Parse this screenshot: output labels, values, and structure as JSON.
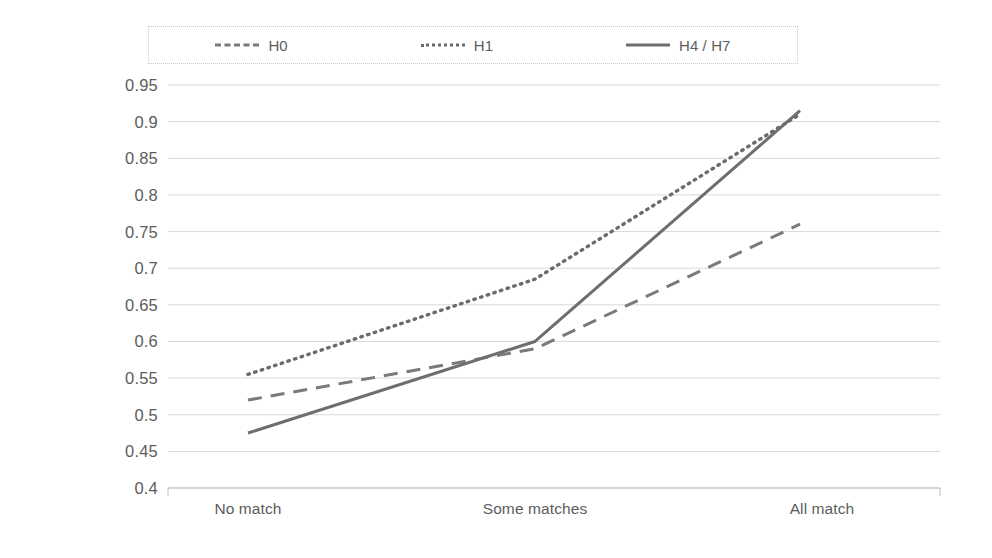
{
  "legend": {
    "position": "top",
    "border": "dotted",
    "entries": [
      {
        "label": "H0",
        "style": "dashed",
        "color": "#7a7a7a"
      },
      {
        "label": "H1",
        "style": "dotted",
        "color": "#6b6b6b"
      },
      {
        "label": "H4 / H7",
        "style": "solid",
        "color": "#6e6e6e"
      }
    ]
  },
  "axes": {
    "y_ticks": [
      "0.95",
      "0.9",
      "0.85",
      "0.8",
      "0.75",
      "0.7",
      "0.65",
      "0.6",
      "0.55",
      "0.5",
      "0.45",
      "0.4"
    ],
    "x_ticks": [
      "No match",
      "Some matches",
      "All match"
    ]
  },
  "chart_data": {
    "type": "line",
    "title": "",
    "subtitle": "",
    "xlabel": "",
    "ylabel": "",
    "categories": [
      "No match",
      "Some matches",
      "All match"
    ],
    "series": [
      {
        "name": "H0",
        "style": "dashed",
        "color": "#7a7a7a",
        "values": [
          0.52,
          0.59,
          0.76
        ]
      },
      {
        "name": "H1",
        "style": "dotted",
        "color": "#6b6b6b",
        "values": [
          0.555,
          0.685,
          0.91
        ]
      },
      {
        "name": "H4 / H7",
        "style": "solid",
        "color": "#6e6e6e",
        "values": [
          0.475,
          0.6,
          0.915
        ]
      }
    ],
    "ylim": [
      0.4,
      0.95
    ],
    "ytick_step": 0.05,
    "grid": "horizontal",
    "legend_position": "top"
  }
}
